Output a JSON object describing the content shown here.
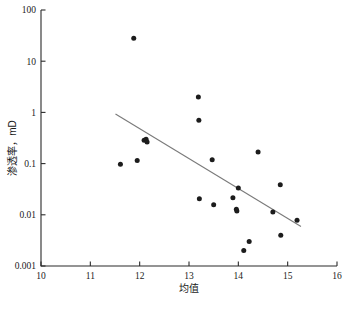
{
  "chart_data": {
    "type": "scatter",
    "title": "",
    "xlabel": "均值",
    "ylabel": "渗透率，mD",
    "xlim": [
      10,
      16
    ],
    "ylim": [
      0.001,
      100
    ],
    "yscale": "log",
    "xscale": "linear",
    "grid": false,
    "legend": null,
    "xticks": [
      "10",
      "11",
      "12",
      "13",
      "14",
      "15",
      "16"
    ],
    "xtick_values": [
      10,
      11,
      12,
      13,
      14,
      15,
      16
    ],
    "yticks": [
      "100",
      "10",
      "1",
      "0.1",
      "0.01",
      "0.001"
    ],
    "ytick_values": [
      100,
      10,
      1,
      0.1,
      0.01,
      0.001
    ],
    "marker": "filled-circle",
    "marker_color": "#1c1c1c",
    "points": [
      {
        "x": 11.61,
        "y": 0.097
      },
      {
        "x": 11.88,
        "y": 28.0
      },
      {
        "x": 11.95,
        "y": 0.115
      },
      {
        "x": 12.09,
        "y": 0.285
      },
      {
        "x": 12.13,
        "y": 0.3
      },
      {
        "x": 12.15,
        "y": 0.265
      },
      {
        "x": 13.19,
        "y": 2.0
      },
      {
        "x": 13.2,
        "y": 0.7
      },
      {
        "x": 13.21,
        "y": 0.0205
      },
      {
        "x": 13.47,
        "y": 0.119
      },
      {
        "x": 13.5,
        "y": 0.0158
      },
      {
        "x": 13.89,
        "y": 0.0215
      },
      {
        "x": 13.96,
        "y": 0.0128
      },
      {
        "x": 13.97,
        "y": 0.0118
      },
      {
        "x": 14.0,
        "y": 0.0335
      },
      {
        "x": 14.11,
        "y": 0.002
      },
      {
        "x": 14.22,
        "y": 0.003
      },
      {
        "x": 14.4,
        "y": 0.168
      },
      {
        "x": 14.7,
        "y": 0.0113
      },
      {
        "x": 14.85,
        "y": 0.0385
      },
      {
        "x": 14.86,
        "y": 0.004
      },
      {
        "x": 15.19,
        "y": 0.0078
      }
    ],
    "trendline": {
      "type": "linear-on-log",
      "x_start": 11.51,
      "y_start": 0.93,
      "x_end": 15.27,
      "y_end": 0.0059,
      "color": "#7a7a7a"
    }
  },
  "caption": {
    "text": ""
  }
}
